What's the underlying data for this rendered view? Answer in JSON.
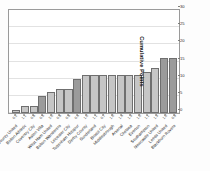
{
  "chart_data": {
    "type": "bar",
    "title": "",
    "subtitle": "",
    "xlabel": "",
    "ylabel": "Cumulative Points",
    "ylim": [
      0,
      30
    ],
    "yticks": [
      0,
      5,
      10,
      15,
      20,
      25,
      30
    ],
    "grid": true,
    "legend": false,
    "legend_position": "none",
    "orientation": "vertical",
    "categories": [
      "Derby County United",
      "Bolton Athletic",
      "Coventry City",
      "Aston Villa",
      "West Ham United",
      "Bolton Wanderers",
      "Leicester City",
      "Tottenham Hotspur",
      "Derby County",
      "Sunderland",
      "Bristol City",
      "Middlesbrough",
      "Arsenal",
      "Chelsea",
      "Everton",
      "Southampton",
      "Newcastle United",
      "Leeds United",
      "Blackburn Rovers"
    ],
    "values": [
      1,
      2,
      2,
      5,
      6,
      7,
      7,
      10,
      11,
      11,
      11,
      11,
      11,
      11,
      11,
      12,
      13,
      16,
      16
    ],
    "value_labels": [
      "0.2",
      "1.1",
      "0.6",
      "0.5",
      "2.0",
      "0.6",
      "0.6",
      "0.4",
      "1.0",
      "1.1",
      "0.7",
      "1.0",
      "1.4",
      "1.3",
      "1.0",
      "1.1",
      "1.3",
      "1.0",
      "0.9"
    ],
    "bar_shades": [
      "light",
      "light",
      "light",
      "dark",
      "light",
      "light",
      "light",
      "dark",
      "light",
      "light",
      "light",
      "light",
      "light",
      "light",
      "light",
      "light",
      "light",
      "dark",
      "dark"
    ],
    "colors": {
      "bar_light": "#c6c6c6",
      "bar_dark": "#9b9b9b",
      "bar_border": "#6f6f6f",
      "gridline": "#e2e2e2",
      "frame": "#9a9a9a",
      "text": "#252525",
      "background": "#ffffff"
    }
  }
}
